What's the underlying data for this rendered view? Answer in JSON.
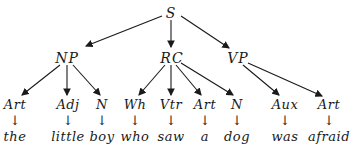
{
  "tree": {
    "root": {
      "label": "S",
      "x": 171,
      "y": 13
    },
    "phrases": [
      {
        "label": "NP",
        "x": 67,
        "y": 58
      },
      {
        "label": "RC",
        "x": 172,
        "y": 58
      },
      {
        "label": "VP",
        "x": 238,
        "y": 58
      }
    ],
    "leaves": [
      {
        "category": "Art",
        "word": "the",
        "x": 15,
        "parent": "NP"
      },
      {
        "category": "Adj",
        "word": "little",
        "x": 68,
        "parent": "NP"
      },
      {
        "category": "N",
        "word": "boy",
        "x": 102,
        "parent": "NP"
      },
      {
        "category": "Wh",
        "word": "who",
        "x": 135,
        "parent": "RC"
      },
      {
        "category": "Vtr",
        "word": "saw",
        "x": 171,
        "parent": "RC"
      },
      {
        "category": "Art",
        "word": "a",
        "x": 205,
        "parent": "RC"
      },
      {
        "category": "N",
        "word": "dog",
        "x": 237,
        "parent": "RC"
      },
      {
        "category": "Aux",
        "word": "was",
        "x": 285,
        "parent": "VP"
      },
      {
        "category": "Art",
        "word": "afraid",
        "x": 329,
        "parent": "VP"
      }
    ],
    "arrow_glyph": "↓"
  }
}
